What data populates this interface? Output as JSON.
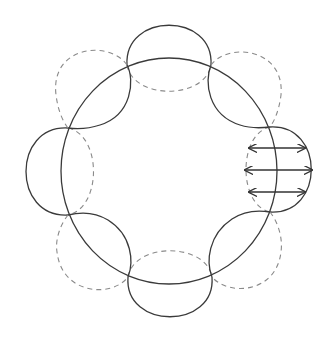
{
  "diagram": {
    "title": "",
    "colors": {
      "solid_stroke": "#3a3a3a",
      "dashed_stroke": "#8a8a8a",
      "arrow_stroke": "#333333",
      "background": "#ffffff"
    },
    "main_ellipse": {
      "cx": 169,
      "cy": 171,
      "rx": 108,
      "ry": 113
    },
    "lobes": [
      {
        "position": "top",
        "solid": "outward",
        "dashed": "inward"
      },
      {
        "position": "top-right",
        "solid": "inward",
        "dashed": "outward"
      },
      {
        "position": "right",
        "solid": "outward",
        "dashed": "inward"
      },
      {
        "position": "bottom-right",
        "solid": "inward",
        "dashed": "outward"
      },
      {
        "position": "bottom",
        "solid": "outward",
        "dashed": "inward"
      },
      {
        "position": "bottom-left",
        "solid": "inward",
        "dashed": "outward"
      },
      {
        "position": "left",
        "solid": "outward",
        "dashed": "inward"
      },
      {
        "position": "top-left",
        "solid": "inward",
        "dashed": "outward"
      }
    ],
    "arrows": [
      {
        "type": "double-headed",
        "x1": 249,
        "x2": 305,
        "y": 148
      },
      {
        "type": "double-headed",
        "x1": 245,
        "x2": 312,
        "y": 170
      },
      {
        "type": "double-headed",
        "x1": 249,
        "x2": 305,
        "y": 192
      }
    ]
  }
}
